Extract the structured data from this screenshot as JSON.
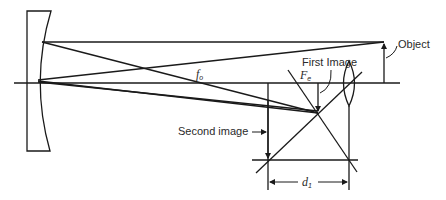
{
  "labels": {
    "object": "Object",
    "first_image": "First Image",
    "second_image": "Second image",
    "fo_main": "f",
    "fo_sub": "o",
    "fe_main": "F",
    "fe_sub": "e",
    "d1_main": "d",
    "d1_sub": "1"
  },
  "elements": {
    "mirror": "concave-mirror",
    "lens": "eyepiece-lens",
    "optical_axis": "optical-axis",
    "object_arrow": "object-arrow"
  },
  "colors": {
    "line": "#1a1a1a",
    "text": "#2a2a2a",
    "background": "#ffffff"
  }
}
